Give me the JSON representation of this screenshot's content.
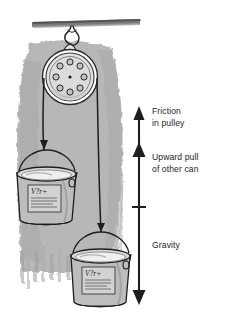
{
  "figure": {
    "background_color": "#ffffff",
    "ink_color": "#1e1e1e",
    "shadow_color": "#b3b3b3",
    "can_fill_color": "#b9b9b9",
    "pulley_fill_color": "#e8e8e8"
  },
  "labels": {
    "friction": {
      "line1": "Friction",
      "line2": "in pulley"
    },
    "upward": {
      "line1": "Upward pull",
      "line2": "of other can"
    },
    "gravity": {
      "line1": "Gravity"
    }
  },
  "force_scale": {
    "orientation": "vertical",
    "top_y": 108,
    "bottom_y": 303,
    "segments": [
      {
        "name": "friction-in-pulley",
        "from_y": 108,
        "to_y": 145
      },
      {
        "name": "upward-pull-of-other-can",
        "from_y": 145,
        "to_y": 207
      },
      {
        "name": "gravity",
        "from_y": 207,
        "to_y": 303
      }
    ],
    "arrowheads": [
      {
        "name": "friction-arrowhead",
        "direction": "up",
        "y": 108
      },
      {
        "name": "upward-pull-arrowhead",
        "direction": "up",
        "y": 145
      },
      {
        "name": "gravity-arrowhead",
        "direction": "down",
        "y": 303
      }
    ],
    "tick_marks": [
      {
        "name": "gravity-divider-tick",
        "y": 207
      }
    ]
  },
  "objects": {
    "ceiling_beam": {
      "name": "ceiling-beam"
    },
    "hook": {
      "name": "ceiling-hook"
    },
    "pulley": {
      "name": "pulley-wheel",
      "hole_count": 9,
      "center": {
        "x": 70,
        "y": 77
      },
      "radius": 27
    },
    "rope_left": {
      "name": "rope-left-strand"
    },
    "rope_right": {
      "name": "rope-right-strand"
    },
    "can_upper": {
      "name": "paint-can-upper",
      "label_text": "V?r+",
      "center": {
        "x": 47,
        "y": 190
      }
    },
    "can_lower": {
      "name": "paint-can-lower",
      "label_text": "V?r+",
      "center": {
        "x": 101,
        "y": 272
      }
    }
  }
}
